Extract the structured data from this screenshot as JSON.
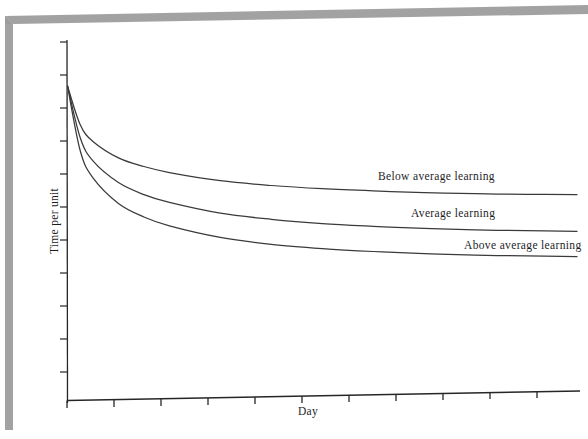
{
  "page": {
    "kind": "scanned-book-figure",
    "background_color": "#ffffff",
    "shadow_color": "#9d9d9d"
  },
  "axes": {
    "x_axis_label": "Day",
    "y_axis_label": "Time per unit",
    "x_tick_count": 11,
    "y_tick_count": 11,
    "axis_color": "#262626"
  },
  "series_labels": {
    "below_average": "Below average learning",
    "average": "Average learning",
    "above_average": "Above average learning"
  },
  "chart_data": {
    "type": "line",
    "title": "",
    "subtitle": "",
    "xlabel": "Day",
    "ylabel": "Time per unit",
    "xlim": [
      0,
      10
    ],
    "ylim": [
      0,
      10
    ],
    "grid": false,
    "legend": "inline-right-of-curves",
    "annotations": [
      "Below average learning",
      "Average learning",
      "Above average learning"
    ],
    "x_tick_labels": [],
    "y_tick_labels": [],
    "x": [
      0,
      0.25,
      0.5,
      1,
      1.5,
      2,
      3,
      4,
      5,
      6,
      7,
      8,
      9,
      10
    ],
    "series": [
      {
        "name": "Below average learning",
        "color": "#3a3a3a",
        "values": [
          9.85,
          8.35,
          7.7,
          7.05,
          6.7,
          6.45,
          6.1,
          5.88,
          5.72,
          5.6,
          5.5,
          5.42,
          5.36,
          5.31
        ]
      },
      {
        "name": "Average learning",
        "color": "#3a3a3a",
        "values": [
          9.85,
          7.85,
          6.95,
          6.1,
          5.62,
          5.3,
          4.85,
          4.58,
          4.38,
          4.24,
          4.12,
          4.03,
          3.96,
          3.9
        ]
      },
      {
        "name": "Above average learning",
        "color": "#3a3a3a",
        "values": [
          9.85,
          7.35,
          6.3,
          5.3,
          4.76,
          4.4,
          3.92,
          3.62,
          3.42,
          3.27,
          3.15,
          3.06,
          2.99,
          2.93
        ]
      }
    ]
  }
}
